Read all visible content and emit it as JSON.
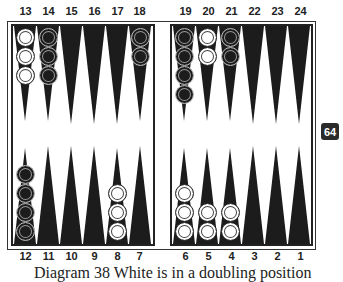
{
  "board": {
    "top_labels": [
      "13",
      "14",
      "15",
      "16",
      "17",
      "18",
      "19",
      "20",
      "21",
      "22",
      "23",
      "24"
    ],
    "bottom_labels": [
      "12",
      "11",
      "10",
      "9",
      "8",
      "7",
      "6",
      "5",
      "4",
      "3",
      "2",
      "1"
    ],
    "colors": {
      "triangle": "#1c1c1c",
      "board_bg": "#ffffff",
      "border": "#222222"
    },
    "checkers": [
      {
        "point": 13,
        "color": "white",
        "count": 3
      },
      {
        "point": 14,
        "color": "black",
        "count": 3
      },
      {
        "point": 18,
        "color": "black",
        "count": 2
      },
      {
        "point": 19,
        "color": "black",
        "count": 4
      },
      {
        "point": 20,
        "color": "white",
        "count": 2
      },
      {
        "point": 21,
        "color": "black",
        "count": 2
      },
      {
        "point": 12,
        "color": "black",
        "count": 4
      },
      {
        "point": 8,
        "color": "white",
        "count": 3
      },
      {
        "point": 6,
        "color": "white",
        "count": 3
      },
      {
        "point": 5,
        "color": "white",
        "count": 2
      },
      {
        "point": 4,
        "color": "white",
        "count": 2
      }
    ]
  },
  "doubling_cube": {
    "value": "64"
  },
  "caption": {
    "text": "Diagram 38 White is in a doubling position"
  }
}
